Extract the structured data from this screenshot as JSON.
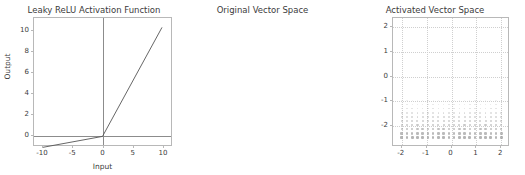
{
  "figure": {
    "background": "#ffffff",
    "width": 525,
    "height": 175
  },
  "chart_data": [
    {
      "type": "line",
      "id": "leaky-relu",
      "title": "Leaky ReLU Activation Function",
      "xlabel": "Input",
      "ylabel": "Output",
      "xlim": [
        -11.5,
        11.5
      ],
      "ylim": [
        -1.6,
        10.6
      ],
      "xticks": [
        -10,
        -5,
        0,
        5,
        10
      ],
      "yticks": [
        0,
        2,
        4,
        6,
        8,
        10
      ],
      "grid": false,
      "legend": "none",
      "line_color": "#555555",
      "series": [
        {
          "name": "Leaky ReLU (alpha=0.1)",
          "x": [
            -10,
            -5,
            0,
            5,
            10
          ],
          "y": [
            -1,
            -0.5,
            0,
            5,
            10
          ]
        }
      ],
      "reference_lines": {
        "x_axis_y": 0,
        "y_axis_x": 0
      }
    },
    {
      "type": "scatter",
      "id": "original-vector-space",
      "title": "Original Vector Space",
      "xlabel": "",
      "ylabel": "",
      "xlim": [
        -2.35,
        2.35
      ],
      "ylim": [
        -2.35,
        2.35
      ],
      "xticks": [
        -2,
        -1,
        0,
        1,
        2
      ],
      "yticks": [
        -2,
        -1,
        0,
        1,
        2
      ],
      "grid": true,
      "grid_style": "dotted",
      "legend": "none",
      "marker": "square",
      "point_color": "#9a9a9a",
      "description": "Grid of sample vectors occupying the lower band of the plane, y from -2.0 to -0.65, x from -2.0 to 2.0; marker size and opacity increase toward the bottom.",
      "x_values": [
        -2.0,
        -1.789,
        -1.579,
        -1.368,
        -1.158,
        -0.947,
        -0.737,
        -0.526,
        -0.316,
        -0.105,
        0.105,
        0.316,
        0.526,
        0.737,
        0.947,
        1.158,
        1.368,
        1.579,
        1.789,
        2.0
      ],
      "y_values": [
        -2.0,
        -1.85,
        -1.7,
        -1.55,
        -1.4,
        -1.25,
        -1.1,
        -0.95,
        -0.8,
        -0.65
      ],
      "n_points": 200
    },
    {
      "type": "scatter",
      "id": "activated-vector-space",
      "title": "Activated Vector Space",
      "xlabel": "",
      "ylabel": "",
      "xlim": [
        -2.35,
        2.35
      ],
      "ylim": [
        -2.35,
        2.35
      ],
      "xticks": [
        -2,
        -1,
        0,
        1,
        2
      ],
      "yticks": [
        -2,
        -1,
        0,
        1,
        2
      ],
      "grid": true,
      "grid_style": "dotted",
      "legend": "none",
      "marker": "square",
      "point_color": "#9a9a9a",
      "description": "After the leaky ReLU, the negative band collapses: points compress onto a near-horizontal line at y about -0.2, bunched densely between x -0.3 and 0.1 then spaced evenly out to x = 2.",
      "x_values": [
        -0.3,
        -0.27,
        -0.24,
        -0.21,
        -0.18,
        -0.15,
        -0.12,
        -0.09,
        -0.06,
        0.0,
        0.105,
        0.316,
        0.526,
        0.737,
        0.947,
        1.158,
        1.368,
        1.579,
        1.789,
        2.0
      ],
      "y_values": [
        -0.2,
        -0.185,
        -0.17,
        -0.155,
        -0.14,
        -0.125,
        -0.11,
        -0.095,
        -0.08,
        -0.065
      ],
      "n_points": 200
    }
  ]
}
